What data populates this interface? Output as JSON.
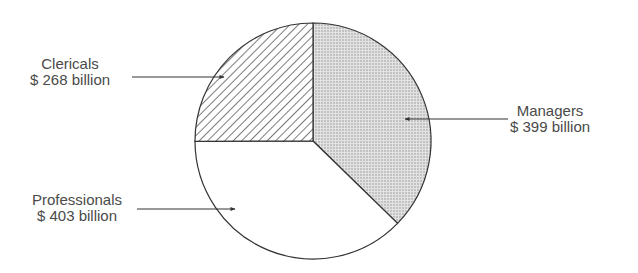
{
  "chart_data": {
    "type": "pie",
    "title": "",
    "unit": "$ billion",
    "start_angle_deg": 0,
    "direction": "clockwise",
    "slices": [
      {
        "name": "Managers",
        "value": 399,
        "label": "Managers",
        "value_label": "$399 billion",
        "fill": "dotted-gray"
      },
      {
        "name": "Professionals",
        "value": 403,
        "label": "Professionals",
        "value_label": "$403 billion",
        "fill": "white"
      },
      {
        "name": "Clericals",
        "value": 268,
        "label": "Clericals",
        "value_label": "$268 billion",
        "fill": "diagonal-hatch"
      }
    ],
    "total": 1070,
    "legend": "none (callout labels with arrows)"
  },
  "labels": {
    "clericals": {
      "name": "Clericals",
      "value": "$ 268 billion"
    },
    "managers": {
      "name": "Managers",
      "value": "$ 399 billion"
    },
    "professionals": {
      "name": "Professionals",
      "value": "$ 403 billion"
    }
  },
  "colors": {
    "outline": "#333333",
    "dot_fill": "#d6d6d6",
    "hatch": "#333333",
    "text": "#4a4a4a"
  }
}
